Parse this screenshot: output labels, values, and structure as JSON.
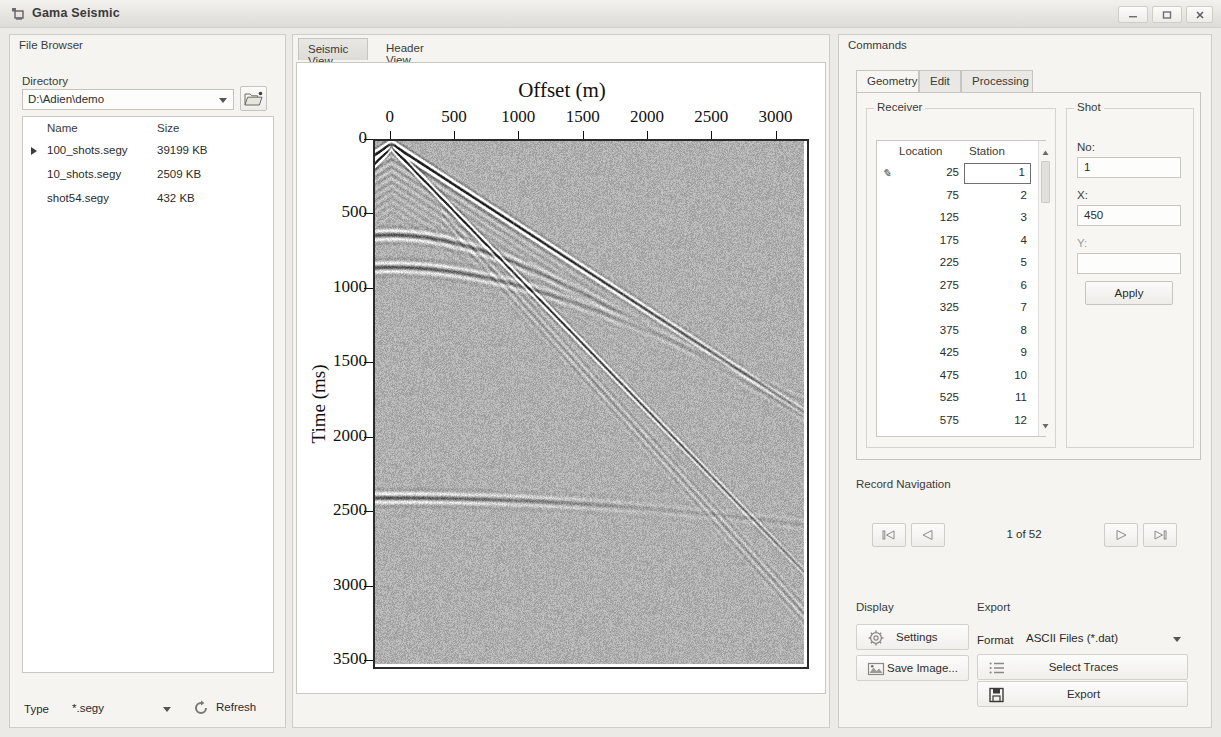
{
  "window": {
    "title": "Gama Seismic",
    "icon": "app-icon",
    "controls": {
      "minimize": "minimize-icon",
      "maximize": "maximize-icon",
      "close": "close-icon"
    }
  },
  "file_browser": {
    "panel_title": "File Browser",
    "directory_label": "Directory",
    "directory_value": "D:\\Adien\\demo",
    "browse_icon": "folder-open-icon",
    "columns": [
      "Name",
      "Size"
    ],
    "files": [
      {
        "name": "100_shots.segy",
        "size": "39199 KB",
        "selected": true
      },
      {
        "name": "10_shots.segy",
        "size": "2509 KB",
        "selected": false
      },
      {
        "name": "shot54.segy",
        "size": "432 KB",
        "selected": false
      }
    ],
    "type_label": "Type",
    "type_value": "*.segy",
    "refresh_label": "Refresh",
    "refresh_icon": "refresh-icon"
  },
  "center": {
    "tabs": [
      {
        "label": "Seismic View",
        "active": true
      },
      {
        "label": "Header View",
        "active": false
      }
    ]
  },
  "chart_data": {
    "type": "heatmap",
    "title": "Offset (m)",
    "xlabel": "Offset (m)",
    "ylabel": "Time (ms)",
    "x_ticks": [
      0,
      500,
      1000,
      1500,
      2000,
      2500,
      3000
    ],
    "y_ticks": [
      0,
      500,
      1000,
      1500,
      2000,
      2500,
      3000,
      3500
    ],
    "xlim": [
      -130,
      3260
    ],
    "ylim": [
      0,
      3560
    ],
    "grid": false,
    "legend": null,
    "events": [
      {
        "name": "direct-arrival",
        "type": "linear",
        "t0_ms": 40,
        "t_at_3000m_ms": 2700
      },
      {
        "name": "refraction-branch",
        "type": "linear",
        "t0_ms": 20,
        "t_at_3000m_ms": 1700
      },
      {
        "name": "reflection-hyperbola-1",
        "type": "hyperbola",
        "t0_ms": 640,
        "v_m_s": 1850
      },
      {
        "name": "reflection-hyperbola-2",
        "type": "hyperbola",
        "t0_ms": 860,
        "v_m_s": 2100
      },
      {
        "name": "deep-reflector",
        "type": "hyperbola",
        "t0_ms": 2430,
        "v_m_s": 3400
      }
    ]
  },
  "commands": {
    "panel_title": "Commands",
    "tabs": [
      {
        "label": "Geometry",
        "active": true
      },
      {
        "label": "Edit",
        "active": false
      },
      {
        "label": "Processing",
        "active": false
      }
    ],
    "receiver": {
      "group_title": "Receiver",
      "columns": [
        "Location",
        "Station"
      ],
      "editing_row": 0,
      "editing_value": "1",
      "rows": [
        {
          "location": "25",
          "station": "1"
        },
        {
          "location": "75",
          "station": "2"
        },
        {
          "location": "125",
          "station": "3"
        },
        {
          "location": "175",
          "station": "4"
        },
        {
          "location": "225",
          "station": "5"
        },
        {
          "location": "275",
          "station": "6"
        },
        {
          "location": "325",
          "station": "7"
        },
        {
          "location": "375",
          "station": "8"
        },
        {
          "location": "425",
          "station": "9"
        },
        {
          "location": "475",
          "station": "10"
        },
        {
          "location": "525",
          "station": "11"
        },
        {
          "location": "575",
          "station": "12"
        }
      ]
    },
    "shot": {
      "group_title": "Shot",
      "no_label": "No:",
      "no_value": "1",
      "x_label": "X:",
      "x_value": "450",
      "y_label": "Y:",
      "y_value": "",
      "apply_label": "Apply"
    },
    "record_navigation": {
      "title": "Record Navigation",
      "counter": "1 of 52",
      "first_icon": "skip-first-icon",
      "prev_icon": "play-prev-icon",
      "next_icon": "play-next-icon",
      "last_icon": "skip-last-icon"
    },
    "display": {
      "title": "Display",
      "settings_label": "Settings",
      "settings_icon": "gear-icon",
      "save_image_label": "Save Image...",
      "save_image_icon": "picture-icon"
    },
    "export": {
      "title": "Export",
      "format_label": "Format",
      "format_value": "ASCII Files (*.dat)",
      "select_traces_label": "Select Traces",
      "select_traces_icon": "list-icon",
      "export_label": "Export",
      "export_icon": "save-disk-icon"
    }
  }
}
